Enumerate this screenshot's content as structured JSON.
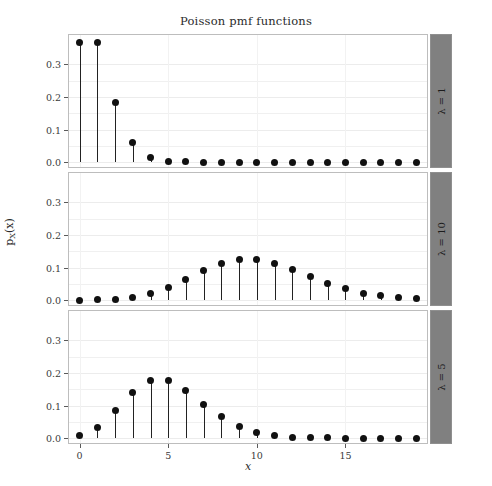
{
  "chart_data": {
    "type": "scatter",
    "title": "Poisson pmf functions",
    "xlabel": "x",
    "ylabel": "p_X(x)",
    "ylabel_main": "p",
    "ylabel_sub": "X",
    "ylabel_arg": "(x)",
    "grid": true,
    "legend_position": "right-strip",
    "xlim": [
      -0.6,
      19.6
    ],
    "ylim": [
      -0.015,
      0.39
    ],
    "xticks": [
      0,
      5,
      10,
      15
    ],
    "xticklabels": [
      "0",
      "5",
      "10",
      "15"
    ],
    "yticks": [
      0.0,
      0.1,
      0.2,
      0.3
    ],
    "yticklabels": [
      "0.0",
      "0.1",
      "0.2",
      "0.3"
    ],
    "x": [
      0,
      1,
      2,
      3,
      4,
      5,
      6,
      7,
      8,
      9,
      10,
      11,
      12,
      13,
      14,
      15,
      16,
      17,
      18,
      19
    ],
    "panels": [
      {
        "strip_label": "λ = 1",
        "lambda": 1,
        "values": [
          0.3679,
          0.3679,
          0.1839,
          0.0613,
          0.0153,
          0.0031,
          0.0005,
          0.0001,
          0.0,
          0.0,
          0.0,
          0.0,
          0.0,
          0.0,
          0.0,
          0.0,
          0.0,
          0.0,
          0.0,
          0.0
        ]
      },
      {
        "strip_label": "λ = 10",
        "lambda": 10,
        "values": [
          0.0,
          0.0005,
          0.0023,
          0.0076,
          0.0189,
          0.0378,
          0.0631,
          0.0901,
          0.1126,
          0.1251,
          0.1251,
          0.1137,
          0.0948,
          0.0729,
          0.0521,
          0.0347,
          0.0217,
          0.0128,
          0.0071,
          0.0037
        ]
      },
      {
        "strip_label": "λ = 5",
        "lambda": 5,
        "values": [
          0.0067,
          0.0337,
          0.0842,
          0.1404,
          0.1755,
          0.1755,
          0.1462,
          0.1044,
          0.0653,
          0.0363,
          0.0181,
          0.0082,
          0.0034,
          0.0013,
          0.0005,
          0.0002,
          0.0,
          0.0,
          0.0,
          0.0
        ]
      }
    ],
    "colors": {
      "point": "#111111",
      "stem": "#222222",
      "strip_background": "#808080",
      "panel_border": "#bdbdbd",
      "grid": "#f0f0f0",
      "background": "#ffffff"
    }
  }
}
